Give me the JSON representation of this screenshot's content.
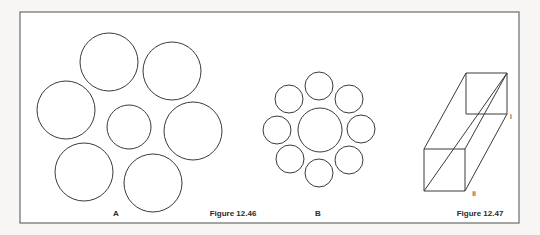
{
  "colors": {
    "background": "#f7f6f4",
    "frame_fill": "#ffffff",
    "frame_stroke": "#6b6b6b",
    "line": "#3a3a3a"
  },
  "frame": {
    "x": 20,
    "y": 12,
    "width": 499,
    "height": 211
  },
  "figure_a": {
    "label": "A",
    "label_pos": {
      "x": 116,
      "y": 213
    },
    "circles": [
      {
        "cx": 109,
        "cy": 62,
        "r": 29
      },
      {
        "cx": 172,
        "cy": 71,
        "r": 29
      },
      {
        "cx": 66,
        "cy": 110,
        "r": 29
      },
      {
        "cx": 129,
        "cy": 127,
        "r": 22
      },
      {
        "cx": 193,
        "cy": 131,
        "r": 29
      },
      {
        "cx": 84,
        "cy": 172,
        "r": 29
      },
      {
        "cx": 153,
        "cy": 183,
        "r": 29
      }
    ]
  },
  "caption_1246": {
    "text": "Figure 12.46",
    "pos": {
      "x": 233,
      "y": 213
    }
  },
  "figure_b": {
    "label": "B",
    "label_pos": {
      "x": 318,
      "y": 213
    },
    "circles": [
      {
        "cx": 320,
        "cy": 130,
        "r": 22
      },
      {
        "cx": 319,
        "cy": 86,
        "r": 14
      },
      {
        "cx": 349,
        "cy": 99,
        "r": 14
      },
      {
        "cx": 361,
        "cy": 129,
        "r": 14
      },
      {
        "cx": 349,
        "cy": 160,
        "r": 14
      },
      {
        "cx": 319,
        "cy": 173,
        "r": 14
      },
      {
        "cx": 290,
        "cy": 159,
        "r": 14
      },
      {
        "cx": 277,
        "cy": 130,
        "r": 14
      },
      {
        "cx": 289,
        "cy": 99,
        "r": 14
      }
    ]
  },
  "figure_box": {
    "edges": [
      [
        466,
        73,
        507,
        73
      ],
      [
        507,
        73,
        507,
        114
      ],
      [
        466,
        73,
        466,
        114
      ],
      [
        466,
        114,
        507,
        114
      ],
      [
        424,
        149,
        465,
        149
      ],
      [
        424,
        149,
        424,
        191
      ],
      [
        465,
        149,
        465,
        191
      ],
      [
        424,
        191,
        465,
        191
      ],
      [
        424,
        149,
        466,
        73
      ],
      [
        465,
        149,
        507,
        73
      ],
      [
        465,
        191,
        507,
        114
      ],
      [
        424,
        191,
        507,
        73
      ]
    ],
    "vertex_labels": [
      {
        "text": "i",
        "x": 511,
        "y": 116
      },
      {
        "text": "ii",
        "x": 474,
        "y": 193
      }
    ]
  },
  "caption_1247": {
    "text": "Figure 12.47",
    "pos": {
      "x": 480,
      "y": 213
    }
  }
}
